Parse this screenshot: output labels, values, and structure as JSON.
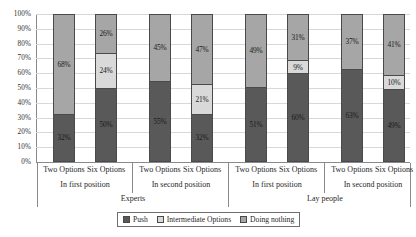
{
  "chart_data": {
    "type": "bar",
    "subtype": "stacked-bar-100",
    "title": "",
    "xlabel": "",
    "ylabel": "",
    "ylim": [
      0,
      100
    ],
    "ytick_labels": [
      "100%",
      "90%",
      "80%",
      "70%",
      "60%",
      "50%",
      "40%",
      "30%",
      "20%",
      "10%",
      "0%"
    ],
    "ytick_values": [
      100,
      90,
      80,
      70,
      60,
      50,
      40,
      30,
      20,
      10,
      0
    ],
    "grid": true,
    "legend_position": "bottom",
    "categories": [
      "Two Options",
      "Six Options",
      "Two Options",
      "Six Options",
      "Two Options",
      "Six Options",
      "Two Options",
      "Six Options"
    ],
    "position_groups": [
      "In first position",
      "In second position",
      "In first position",
      "In second position"
    ],
    "population_groups": [
      "Experts",
      "Lay people"
    ],
    "series": [
      {
        "name": "Push",
        "color": "#595959",
        "values": [
          32,
          50,
          55,
          32,
          51,
          60,
          63,
          49
        ],
        "labels": [
          "32%",
          "50%",
          "55%",
          "32%",
          "51%",
          "60%",
          "63%",
          "49%"
        ]
      },
      {
        "name": "Intermediate Options",
        "color": "#d9d9d9",
        "values": [
          0,
          24,
          0,
          21,
          0,
          9,
          0,
          10
        ],
        "labels": [
          "",
          "24%",
          "",
          "21%",
          "",
          "9%",
          "",
          "10%"
        ]
      },
      {
        "name": "Doing nothing",
        "color": "#a6a6a6",
        "values": [
          68,
          26,
          45,
          47,
          49,
          31,
          37,
          41
        ],
        "labels": [
          "68%",
          "26%",
          "45%",
          "47%",
          "49%",
          "31%",
          "37%",
          "41%"
        ]
      }
    ]
  },
  "legend": {
    "items": [
      {
        "label": "Push",
        "color": "#595959"
      },
      {
        "label": "Intermediate Options",
        "color": "#d9d9d9"
      },
      {
        "label": "Doing nothing",
        "color": "#a6a6a6"
      }
    ]
  }
}
